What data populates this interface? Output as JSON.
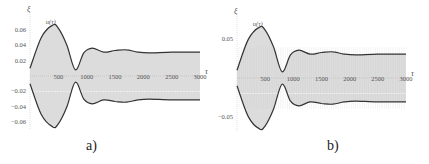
{
  "figure": {
    "panels": [
      {
        "id": "a",
        "caption": "a)",
        "y_axis_label": "ξ",
        "x_axis_label": "τ",
        "curve_label": "u(τ)"
      },
      {
        "id": "b",
        "caption": "b)",
        "y_axis_label": "ξ",
        "x_axis_label": "τ",
        "curve_label": "u(τ)"
      }
    ]
  },
  "chart_data": [
    {
      "type": "area",
      "title": "a)",
      "xlabel": "τ",
      "ylabel": "ξ",
      "annotation": "u(τ)",
      "x_ticks": [
        500,
        1000,
        1500,
        2000,
        2500,
        3000
      ],
      "y_ticks": [
        -0.06,
        -0.04,
        -0.02,
        0.02,
        0.04,
        0.06
      ],
      "xlim": [
        0,
        3000
      ],
      "ylim": [
        -0.07,
        0.07
      ],
      "grid": false,
      "series": [
        {
          "name": "upper envelope",
          "x": [
            0,
            200,
            400,
            500,
            650,
            800,
            950,
            1100,
            1300,
            1500,
            1700,
            1900,
            2100,
            2500,
            3000
          ],
          "values": [
            0.01,
            0.05,
            0.066,
            0.062,
            0.04,
            0.008,
            0.03,
            0.036,
            0.031,
            0.033,
            0.034,
            0.031,
            0.03,
            0.031,
            0.031
          ]
        },
        {
          "name": "lower envelope",
          "x": [
            0,
            200,
            400,
            500,
            650,
            800,
            950,
            1100,
            1300,
            1500,
            1700,
            1900,
            2100,
            2500,
            3000
          ],
          "values": [
            -0.01,
            -0.05,
            -0.066,
            -0.062,
            -0.04,
            -0.008,
            -0.03,
            -0.036,
            -0.031,
            -0.033,
            -0.034,
            -0.031,
            -0.03,
            -0.031,
            -0.031
          ]
        }
      ]
    },
    {
      "type": "area",
      "title": "b)",
      "xlabel": "τ",
      "ylabel": "ξ",
      "annotation": "u(τ)",
      "x_ticks": [
        500,
        1000,
        1500,
        2000,
        2500,
        3000
      ],
      "y_ticks": [
        -0.05,
        0.05
      ],
      "xlim": [
        0,
        3000
      ],
      "ylim": [
        -0.07,
        0.07
      ],
      "grid": false,
      "series": [
        {
          "name": "upper envelope",
          "x": [
            0,
            200,
            400,
            500,
            650,
            800,
            950,
            1100,
            1300,
            1500,
            1700,
            1900,
            2100,
            2500,
            3000
          ],
          "values": [
            0.01,
            0.05,
            0.066,
            0.062,
            0.04,
            0.008,
            0.03,
            0.036,
            0.031,
            0.033,
            0.034,
            0.031,
            0.03,
            0.031,
            0.031
          ]
        },
        {
          "name": "lower envelope",
          "x": [
            0,
            200,
            400,
            500,
            650,
            800,
            950,
            1100,
            1300,
            1500,
            1700,
            1900,
            2100,
            2500,
            3000
          ],
          "values": [
            -0.01,
            -0.05,
            -0.066,
            -0.062,
            -0.04,
            -0.008,
            -0.03,
            -0.036,
            -0.031,
            -0.033,
            -0.034,
            -0.031,
            -0.03,
            -0.031,
            -0.031
          ]
        }
      ]
    }
  ]
}
